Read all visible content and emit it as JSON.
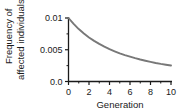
{
  "chart_data": {
    "type": "line",
    "title": "",
    "xlabel": "Generation",
    "ylabel": "Frequency of affected individuals",
    "ylabel_line1": "Frequency of",
    "ylabel_line2": "affected individuals",
    "xlim": [
      0,
      10
    ],
    "ylim": [
      0,
      0.01
    ],
    "grid": false,
    "legend": "none",
    "line_color": "#787878",
    "axis_color": "#1a1a1a",
    "x_ticks": [
      0,
      2,
      4,
      6,
      8,
      10
    ],
    "x_tick_labels": [
      "0",
      "2",
      "4",
      "6",
      "8",
      "10"
    ],
    "x_minor_ticks": [
      1,
      3,
      5,
      7,
      9
    ],
    "y_ticks": [
      0,
      0.005,
      0.01
    ],
    "y_tick_labels": [
      "0.0",
      "0.005",
      "0.01"
    ],
    "y_minor_ticks": [
      0.0025,
      0.0075
    ],
    "x": [
      0,
      0.5,
      1,
      1.5,
      2,
      2.5,
      3,
      3.5,
      4,
      4.5,
      5,
      5.5,
      6,
      6.5,
      7,
      7.5,
      8,
      8.5,
      9,
      9.5,
      10
    ],
    "values": [
      0.01,
      0.00907,
      0.00826,
      0.00756,
      0.00694,
      0.0064,
      0.00592,
      0.00549,
      0.0051,
      0.00476,
      0.00444,
      0.00416,
      0.00391,
      0.00367,
      0.00346,
      0.00327,
      0.00309,
      0.00292,
      0.00277,
      0.00264,
      0.00251
    ],
    "series": [
      {
        "name": "Frequency of affected individuals",
        "values": [
          0.01,
          0.00907,
          0.00826,
          0.00756,
          0.00694,
          0.0064,
          0.00592,
          0.00549,
          0.0051,
          0.00476,
          0.00444,
          0.00416,
          0.00391,
          0.00367,
          0.00346,
          0.00327,
          0.00309,
          0.00292,
          0.00277,
          0.00264,
          0.00251
        ]
      }
    ]
  }
}
